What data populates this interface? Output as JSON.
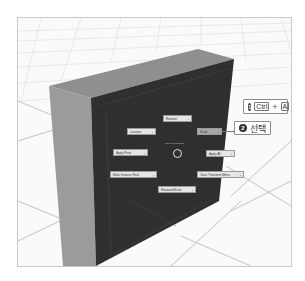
{
  "scene": {
    "colors": {
      "background": "#fafafa",
      "grid": "#dcdcdc",
      "box_top": "#8f8f8f",
      "box_left": "#9b9b9b",
      "box_front": "#2e2e2e",
      "edge_line": "#4a4a4a"
    }
  },
  "pie_menu": {
    "title": "Object Transform",
    "items": [
      {
        "label": "Rotation",
        "active": false
      },
      {
        "label": "Location",
        "active": false
      },
      {
        "label": "Scale",
        "active": true
      },
      {
        "label": "Apply Pivot",
        "active": false
      },
      {
        "label": "Apply All",
        "active": false
      },
      {
        "label": "Bake Instance Real",
        "active": false
      },
      {
        "label": "Clear Transform Menu",
        "active": false
      },
      {
        "label": "Rotation&Scale",
        "active": false
      }
    ],
    "chevron": "›"
  },
  "callouts": [
    {
      "number": "1",
      "keys": [
        "Ctrl",
        "A"
      ],
      "plus": "+"
    },
    {
      "number": "2",
      "text": "선택"
    }
  ]
}
